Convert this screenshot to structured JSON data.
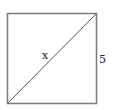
{
  "diagram": {
    "type": "square-with-diagonal",
    "square": {
      "x": 7,
      "y": 13,
      "size": 89
    },
    "diagonal": {
      "from": "bottom-left",
      "to": "top-right"
    },
    "labels": {
      "diagonal": "x",
      "side": "5"
    },
    "colors": {
      "stroke": "#777777",
      "text": "#222222",
      "background": "#ffffff"
    }
  }
}
